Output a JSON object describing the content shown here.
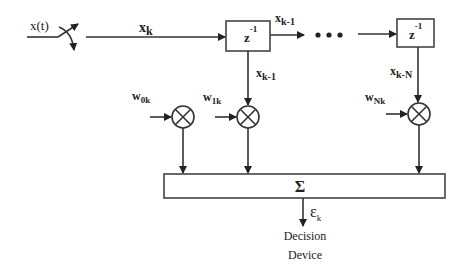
{
  "diagram": {
    "type": "adaptive-transversal-filter",
    "input": {
      "label": "x(t)"
    },
    "sampled": {
      "label": "x",
      "sub": "k"
    },
    "delays": [
      {
        "label": "z",
        "sup": "-1",
        "out_label": "x",
        "out_sub": "k-1",
        "tap_label": "x",
        "tap_sub": "k-1"
      },
      {
        "label": "z",
        "sup": "-1",
        "tap_label": "x",
        "tap_sub": "k-N"
      }
    ],
    "ellipsis": "• • •",
    "weights": [
      {
        "label": "w",
        "sub": "0k"
      },
      {
        "label": "w",
        "sub": "1k"
      },
      {
        "label": "w",
        "sub": "Nk"
      }
    ],
    "multiplier_symbol": "×",
    "summer": {
      "label": "Σ"
    },
    "output": {
      "label": "ε",
      "sub": "k"
    },
    "decision": {
      "line1": "Decision",
      "line2": "Device"
    },
    "colors": {
      "stroke": "#333333",
      "text": "#222222",
      "background": "#ffffff"
    }
  }
}
